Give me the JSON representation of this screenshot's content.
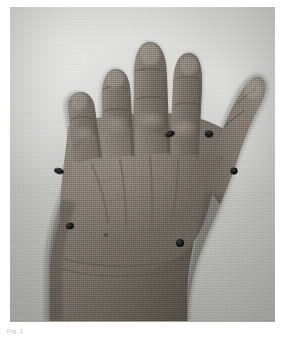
{
  "page": {
    "background_color": "#ffffff",
    "width": 282,
    "height": 338
  },
  "figure": {
    "name": "clinical-hand-photograph",
    "modality": "black-and-white photograph",
    "view": "dorsal view of right hand with thumb abducted",
    "background_color": "#c6c6c3",
    "skin_tone_color": "#6f6862",
    "marker_color": "#1a1a1a",
    "frame": {
      "x": 10,
      "y": 7,
      "width": 265,
      "height": 315
    }
  },
  "caption": {
    "text": "Fig. 1",
    "color": "#b7b7b5",
    "legible": false
  },
  "markers": [
    {
      "id": "marker-1",
      "label": "index metacarpophalangeal marker",
      "x": 170,
      "y": 134,
      "rx": 5.0,
      "ry": 3.0,
      "rotation": -18
    },
    {
      "id": "marker-2",
      "label": "first web space marker",
      "x": 209,
      "y": 134,
      "rx": 4.2,
      "ry": 3.4,
      "rotation": 10
    },
    {
      "id": "marker-3",
      "label": "thumb interphalangeal marker",
      "x": 234,
      "y": 171,
      "rx": 3.6,
      "ry": 3.4,
      "rotation": 0
    },
    {
      "id": "marker-4",
      "label": "ulnar hand border marker",
      "x": 59,
      "y": 171,
      "rx": 5.0,
      "ry": 3.0,
      "rotation": 14
    },
    {
      "id": "marker-5",
      "label": "distal forearm marker",
      "x": 70,
      "y": 226,
      "rx": 4.0,
      "ry": 3.2,
      "rotation": -8
    },
    {
      "id": "marker-6",
      "label": "thenar eminence marker",
      "x": 180,
      "y": 243,
      "rx": 4.0,
      "ry": 4.0,
      "rotation": 0
    }
  ],
  "anatomy": {
    "digits": [
      {
        "id": "digit-2",
        "label": "index finger"
      },
      {
        "id": "digit-3",
        "label": "middle finger"
      },
      {
        "id": "digit-4",
        "label": "ring finger"
      },
      {
        "id": "digit-5",
        "label": "little finger"
      },
      {
        "id": "digit-1",
        "label": "thumb"
      }
    ],
    "regions": [
      {
        "id": "dorsum",
        "label": "dorsum of hand"
      },
      {
        "id": "wrist",
        "label": "wrist"
      },
      {
        "id": "forearm",
        "label": "distal forearm"
      }
    ]
  }
}
